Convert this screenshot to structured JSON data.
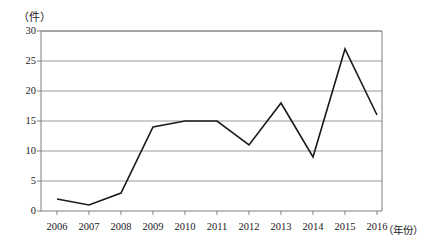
{
  "chart_data": {
    "type": "line",
    "title": "",
    "xlabel": "（年份）",
    "ylabel": "（件）",
    "categories": [
      "2006",
      "2007",
      "2008",
      "2009",
      "2010",
      "2011",
      "2012",
      "2013",
      "2014",
      "2015",
      "2016"
    ],
    "values": [
      2,
      1,
      3,
      14,
      15,
      15,
      11,
      18,
      9,
      27,
      16
    ],
    "series": [
      {
        "name": "",
        "values": [
          2,
          1,
          3,
          14,
          15,
          15,
          11,
          18,
          9,
          27,
          16
        ]
      }
    ],
    "ylim": [
      0,
      30
    ],
    "ytick_labels": [
      "0",
      "5",
      "10",
      "15",
      "20",
      "25",
      "30"
    ],
    "ytick_values": [
      0,
      5,
      10,
      15,
      20,
      25,
      30
    ],
    "xtick_labels": [
      "2006",
      "2007",
      "2008",
      "2009",
      "2010",
      "2011",
      "2012",
      "2013",
      "2014",
      "2015",
      "2016"
    ],
    "grid": "horizontal",
    "legend": "none",
    "line_color": "#1a1a1a",
    "grid_color": "#9a9a9a",
    "axis_color": "#808080",
    "background_color": "#ffffff"
  }
}
